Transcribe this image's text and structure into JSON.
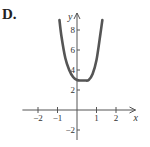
{
  "option_label": "D.",
  "chart_data": {
    "type": "line",
    "title": "",
    "xlabel": "x",
    "ylabel": "y",
    "xlim": [
      -2.8,
      3.0
    ],
    "ylim": [
      -3.0,
      10.0
    ],
    "x_ticks": [
      -2,
      -1,
      1,
      2
    ],
    "y_ticks": [
      -2,
      2,
      4,
      6,
      8
    ],
    "grid": false,
    "series": [
      {
        "name": "curve",
        "color": "#555555",
        "x": [
          -0.9,
          -0.8,
          -0.6,
          -0.4,
          -0.2,
          0,
          0.2,
          0.4,
          0.6,
          0.8,
          1.0,
          1.2,
          1.3
        ],
        "y": [
          9.0,
          7.4,
          5.2,
          4.0,
          3.3,
          3.0,
          2.95,
          2.95,
          3.0,
          3.6,
          5.0,
          7.6,
          9.0
        ]
      }
    ]
  }
}
